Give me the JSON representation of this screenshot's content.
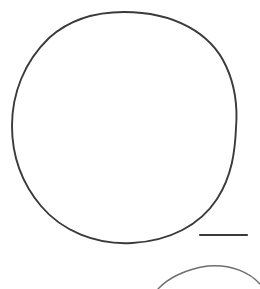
{
  "figure": {
    "type": "line-drawing",
    "width": 260,
    "height": 289,
    "background_color": "#ffffff",
    "stroke_color": "#3a3a3a"
  },
  "shapes": {
    "primary_outline": {
      "name": "large-circle-outline",
      "kind": "closed-curve",
      "center_x": 124.5,
      "center_y": 127.5,
      "radius_x": 112,
      "radius_y": 115.5,
      "bounds": {
        "left": 12,
        "top": 12,
        "right": 237,
        "bottom": 243
      },
      "stroke_color": "#3a3a3a",
      "stroke_width": 1.9,
      "path": "M 124 12 C 174 12 211 33 226 66 C 238 92 237 116 236 128 C 235 151 232 176 217 199 C 200 225 170 241 132 243 C 96 245 62 231 41 206 C 20 181 12 153 12 126 C 12 94 24 62 49 38 C 71 18 98 12 124 12 Z"
    },
    "secondary_outline": {
      "name": "partial-circle-arc-bottom",
      "kind": "open-arc",
      "apex_x": 212,
      "apex_y": 266,
      "bounds": {
        "left": 158,
        "top": 266,
        "right": 260,
        "bottom": 289
      },
      "stroke_color": "#6e6e6e",
      "stroke_width": 1.4,
      "path": "M 158 289 C 168 278 186 269 208 266 C 232 264 250 273 260 284"
    },
    "scale_bar": {
      "name": "scale-bar",
      "kind": "horizontal-rule",
      "x1": 200,
      "y1": 235,
      "x2": 247,
      "y2": 235,
      "length_px": 47,
      "stroke_color": "#3a3a3a",
      "stroke_width": 2.2
    }
  },
  "labels": {
    "scale_bar_caption": "",
    "title": "",
    "annotations": []
  }
}
